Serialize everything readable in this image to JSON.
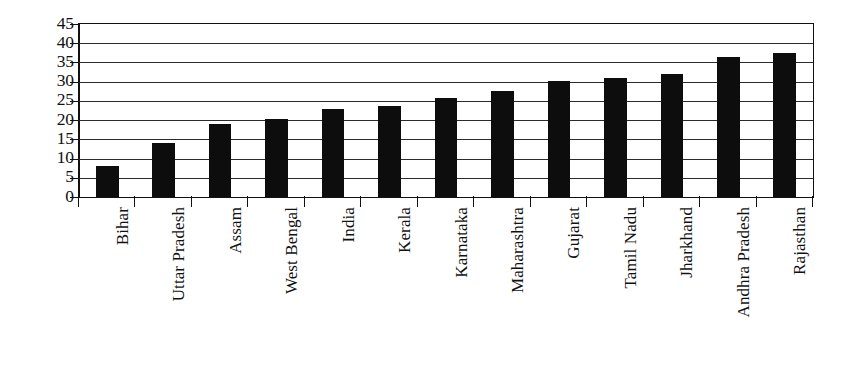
{
  "chart_data": {
    "type": "bar",
    "title": "",
    "subtitle": "",
    "xlabel": "",
    "ylabel": "",
    "ylim": [
      0,
      45
    ],
    "ytick_step": 5,
    "yticks": [
      "45",
      "40",
      "35",
      "30",
      "25",
      "20",
      "15",
      "10",
      "5",
      "0"
    ],
    "grid": true,
    "legend": null,
    "orientation": "vertical",
    "bar_color": "#0d0d0d",
    "xtick_label_rotation": 90,
    "categories": [
      "Bihar",
      "Uttar Pradesh",
      "Assam",
      "West Bengal",
      "India",
      "Kerala",
      "Karnataka",
      "Maharashtra",
      "Gujarat",
      "Tamil Nadu",
      "Jharkhand",
      "Andhra Pradesh",
      "Rajasthan"
    ],
    "values": [
      8,
      14,
      19,
      20.3,
      23,
      23.7,
      25.7,
      27.5,
      30.3,
      31,
      32,
      36.5,
      37.5
    ]
  }
}
